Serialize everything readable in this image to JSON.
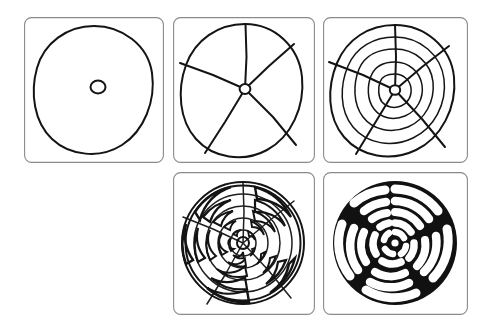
{
  "figure": {
    "background_color": "#ffffff",
    "ink_color": "#141414",
    "frame_color": "#8a8a8a",
    "panel_count": 5,
    "canvas": {
      "width": 491,
      "height": 335
    }
  },
  "panels": [
    {
      "id": "panel-1",
      "step": "1",
      "caption": "",
      "name": "step-circle-and-center",
      "description": "Hand-drawn outer circle with a small circle marking the centre",
      "x": 24,
      "y": 17,
      "width": 140,
      "height": 146,
      "elements": {
        "outer_circle": "hand-drawn circle",
        "center_dot": "small circle at centre"
      }
    },
    {
      "id": "panel-2",
      "step": "2",
      "caption": "",
      "name": "step-five-spokes",
      "description": "Circle divided by five radial spokes into five sectors",
      "x": 173,
      "y": 17,
      "width": 142,
      "height": 146,
      "elements": {
        "outer_circle": "hand-drawn circle",
        "center_dot": "small circle at centre",
        "spoke_count": 5,
        "spoke_angles_deg": [
          -90,
          -36,
          40,
          122,
          196
        ]
      }
    },
    {
      "id": "panel-3",
      "step": "3",
      "caption": "",
      "name": "step-concentric-rings",
      "description": "Five spokes plus five concentric rings forming a polar grid",
      "x": 323,
      "y": 17,
      "width": 145,
      "height": 146,
      "elements": {
        "outer_circle": "hand-drawn circle",
        "center_dot": "small circle at centre",
        "spoke_count": 5,
        "ring_count": 5,
        "ring_radii_fraction": [
          1.0,
          0.82,
          0.64,
          0.46,
          0.28
        ]
      }
    },
    {
      "id": "panel-4",
      "step": "4",
      "caption": "",
      "name": "step-labyrinth-outline",
      "description": "Labyrinth walls traced as rounded outlines over the polar grid",
      "x": 173,
      "y": 172,
      "width": 142,
      "height": 143,
      "elements": {
        "grid_visible": "true",
        "wall_style": "double-line rounded outline",
        "ring_count": 5,
        "spoke_count": 5
      }
    },
    {
      "id": "panel-5",
      "step": "5",
      "caption": "",
      "name": "step-labyrinth-filled",
      "description": "Finished labyrinth with walls filled solid black and path left white",
      "x": 323,
      "y": 172,
      "width": 145,
      "height": 143,
      "elements": {
        "fill": "#111111",
        "path": "#ffffff",
        "ring_count": 5,
        "spoke_count": 5
      }
    }
  ]
}
